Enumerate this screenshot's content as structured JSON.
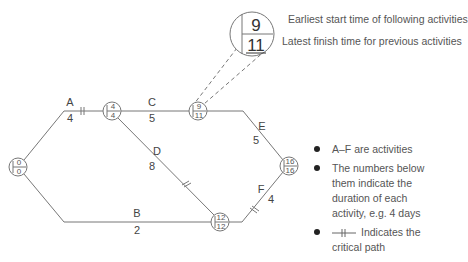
{
  "diagram": {
    "type": "critical-path-network",
    "nodes": [
      {
        "id": 1,
        "top": "0",
        "bottom": "0"
      },
      {
        "id": 2,
        "top": "4",
        "bottom": "4"
      },
      {
        "id": 3,
        "top": "9",
        "bottom": "11"
      },
      {
        "id": 4,
        "top": "12",
        "bottom": "12"
      },
      {
        "id": 5,
        "top": "16",
        "bottom": "16"
      }
    ],
    "activities": [
      {
        "label": "A",
        "duration": "4",
        "critical": true
      },
      {
        "label": "B",
        "duration": "2",
        "critical": false
      },
      {
        "label": "C",
        "duration": "5",
        "critical": false
      },
      {
        "label": "D",
        "duration": "8",
        "critical": true
      },
      {
        "label": "E",
        "duration": "5",
        "critical": false
      },
      {
        "label": "F",
        "duration": "4",
        "critical": true
      }
    ],
    "callout": {
      "top": "9",
      "bottom": "11",
      "top_label": "Earliest start time of following activities",
      "bottom_label": "Latest finish time for previous activities"
    },
    "legend": [
      "A–F are activities",
      "The numbers below them indicate the duration of each activity, e.g. 4 days",
      "Indicates the critical path"
    ],
    "colors": {
      "line": "#777777",
      "text": "#444444",
      "bullet": "#222222"
    }
  }
}
